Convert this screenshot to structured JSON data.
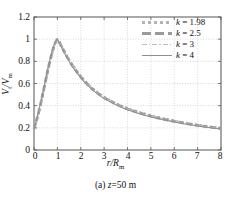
{
  "figure": {
    "caption_prefix": "(a)",
    "caption_var": "z",
    "caption_rest": "=50 m"
  },
  "chart_data": {
    "type": "line",
    "title": "",
    "xlabel": "r/R",
    "xlabel_sub": "m",
    "ylabel": "V/V",
    "ylabel_sub_num": "t",
    "ylabel_sub_den": "m",
    "xlim": [
      0,
      8
    ],
    "ylim": [
      0,
      1.2
    ],
    "xticks": [
      "0",
      "1",
      "2",
      "3",
      "4",
      "5",
      "6",
      "7",
      "8"
    ],
    "yticks": [
      "0",
      "0.2",
      "0.4",
      "0.6",
      "0.8",
      "1",
      "1.2"
    ],
    "grid": true,
    "grid_style": "dotted",
    "legend_position": "top-right",
    "line_color": "#9a9a9a",
    "axis_color": "#555555",
    "grid_color": "#c8c8c8",
    "series": [
      {
        "name": "k = 1.98",
        "k": 1.98,
        "style": "dotted",
        "color": "#b3b3b3",
        "x": [
          0,
          0.1,
          0.2,
          0.3,
          0.4,
          0.5,
          0.6,
          0.7,
          0.8,
          0.9,
          1.0,
          1.1,
          1.2,
          1.4,
          1.6,
          1.8,
          2.0,
          2.25,
          2.5,
          2.75,
          3.0,
          3.5,
          4.0,
          4.5,
          5.0,
          5.5,
          6.0,
          6.5,
          7.0,
          7.5,
          8.0
        ],
        "values": [
          0.19,
          0.26,
          0.34,
          0.43,
          0.52,
          0.62,
          0.72,
          0.81,
          0.89,
          0.96,
          1.0,
          0.97,
          0.93,
          0.85,
          0.78,
          0.72,
          0.665,
          0.605,
          0.555,
          0.513,
          0.477,
          0.42,
          0.375,
          0.34,
          0.31,
          0.285,
          0.262,
          0.243,
          0.226,
          0.21,
          0.197
        ]
      },
      {
        "name": "k = 2.5",
        "k": 2.5,
        "style": "dashed",
        "color": "#9a9a9a",
        "x": [
          0,
          0.1,
          0.2,
          0.3,
          0.4,
          0.5,
          0.6,
          0.7,
          0.8,
          0.9,
          1.0,
          1.1,
          1.2,
          1.4,
          1.6,
          1.8,
          2.0,
          2.25,
          2.5,
          2.75,
          3.0,
          3.5,
          4.0,
          4.5,
          5.0,
          5.5,
          6.0,
          6.5,
          7.0,
          7.5,
          8.0
        ],
        "values": [
          0.19,
          0.26,
          0.34,
          0.43,
          0.53,
          0.63,
          0.73,
          0.82,
          0.9,
          0.965,
          1.0,
          0.965,
          0.925,
          0.845,
          0.775,
          0.715,
          0.66,
          0.6,
          0.55,
          0.508,
          0.472,
          0.415,
          0.37,
          0.335,
          0.305,
          0.28,
          0.258,
          0.239,
          0.222,
          0.207,
          0.194
        ]
      },
      {
        "name": "k = 3",
        "k": 3,
        "style": "dashdot",
        "color": "#bdbdbd",
        "x": [
          0,
          0.1,
          0.2,
          0.3,
          0.4,
          0.5,
          0.6,
          0.7,
          0.8,
          0.9,
          1.0,
          1.1,
          1.2,
          1.4,
          1.6,
          1.8,
          2.0,
          2.25,
          2.5,
          2.75,
          3.0,
          3.5,
          4.0,
          4.5,
          5.0,
          5.5,
          6.0,
          6.5,
          7.0,
          7.5,
          8.0
        ],
        "values": [
          0.19,
          0.265,
          0.345,
          0.435,
          0.535,
          0.635,
          0.735,
          0.825,
          0.905,
          0.97,
          1.0,
          0.962,
          0.92,
          0.84,
          0.77,
          0.71,
          0.655,
          0.595,
          0.546,
          0.504,
          0.468,
          0.411,
          0.366,
          0.331,
          0.301,
          0.277,
          0.255,
          0.236,
          0.219,
          0.204,
          0.191
        ]
      },
      {
        "name": "k = 4",
        "k": 4,
        "style": "solid",
        "color": "#8e8e8e",
        "x": [
          0,
          0.1,
          0.2,
          0.3,
          0.4,
          0.5,
          0.6,
          0.7,
          0.8,
          0.9,
          1.0,
          1.1,
          1.2,
          1.4,
          1.6,
          1.8,
          2.0,
          2.25,
          2.5,
          2.75,
          3.0,
          3.5,
          4.0,
          4.5,
          5.0,
          5.5,
          6.0,
          6.5,
          7.0,
          7.5,
          8.0
        ],
        "values": [
          0.19,
          0.268,
          0.35,
          0.44,
          0.54,
          0.64,
          0.74,
          0.83,
          0.91,
          0.972,
          1.0,
          0.958,
          0.915,
          0.835,
          0.764,
          0.704,
          0.65,
          0.59,
          0.541,
          0.499,
          0.463,
          0.407,
          0.362,
          0.327,
          0.298,
          0.274,
          0.252,
          0.233,
          0.217,
          0.202,
          0.189
        ]
      }
    ]
  },
  "legend": {
    "entries": [
      {
        "label_k": "k",
        "label_rest": " = 1.98"
      },
      {
        "label_k": "k",
        "label_rest": " = 2.5"
      },
      {
        "label_k": "k",
        "label_rest": " = 3"
      },
      {
        "label_k": "k",
        "label_rest": " = 4"
      }
    ]
  }
}
